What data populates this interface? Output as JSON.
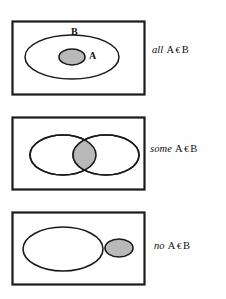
{
  "figure": {
    "background_color": "#fefefe",
    "stroke_color": "#1a1a1a",
    "shade_color": "#b9b9b9"
  },
  "panels": [
    {
      "id": "panel-all",
      "relation": "subset",
      "set_labels": {
        "outer": "B",
        "inner": "A"
      },
      "caption": {
        "quantifier": "all",
        "left_term": "A",
        "relation_symbol": "€",
        "right_term": "B"
      },
      "box": {
        "x": 12,
        "y": 21,
        "w": 133,
        "h": 74
      },
      "shapes": [
        {
          "name": "outer-ellipse-b",
          "cx": 72,
          "cy": 57,
          "rx": 47,
          "ry": 22,
          "filled": false
        },
        {
          "name": "inner-ellipse-a",
          "cx": 72,
          "cy": 57,
          "rx": 13,
          "ry": 8,
          "filled": true
        }
      ]
    },
    {
      "id": "panel-some",
      "relation": "overlap",
      "set_labels": {
        "left": "B",
        "right": "A"
      },
      "caption": {
        "quantifier": "some",
        "left_term": "A",
        "relation_symbol": "€",
        "right_term": "B"
      },
      "box": {
        "x": 12,
        "y": 117,
        "w": 133,
        "h": 73
      },
      "shapes": [
        {
          "name": "ellipse-b",
          "cx": 63,
          "cy": 155,
          "rx": 33,
          "ry": 20,
          "filled": false
        },
        {
          "name": "ellipse-a",
          "cx": 106,
          "cy": 155,
          "rx": 33,
          "ry": 20,
          "filled": false
        },
        {
          "name": "intersection-lens",
          "filled": true
        }
      ]
    },
    {
      "id": "panel-no",
      "relation": "disjoint",
      "set_labels": {
        "left": "B",
        "right": "A"
      },
      "caption": {
        "quantifier": "no",
        "left_term": "A",
        "relation_symbol": "€",
        "right_term": "B"
      },
      "box": {
        "x": 12,
        "y": 212,
        "w": 133,
        "h": 73
      },
      "shapes": [
        {
          "name": "ellipse-b",
          "cx": 63,
          "cy": 249,
          "rx": 40,
          "ry": 22,
          "filled": false
        },
        {
          "name": "ellipse-a",
          "cx": 119,
          "cy": 248,
          "rx": 14,
          "ry": 9,
          "filled": true
        }
      ]
    }
  ]
}
